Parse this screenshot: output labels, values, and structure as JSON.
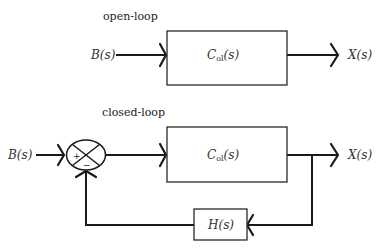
{
  "open_loop": {
    "caption": "open-loop",
    "input_label": "B(s)",
    "block": {
      "main": "C",
      "subscript": "ol",
      "arg": "(s)"
    },
    "output_label": "X(s)"
  },
  "closed_loop": {
    "caption": "closed-loop",
    "input_label": "B(s)",
    "summing_junction": {
      "plus": "+",
      "minus": "−"
    },
    "block": {
      "main": "C",
      "subscript": "ol",
      "arg": "(s)"
    },
    "feedback_block": "H(s)",
    "output_label": "X(s)"
  },
  "colors": {
    "line": "#1a1a1a",
    "background": "#ffffff"
  }
}
